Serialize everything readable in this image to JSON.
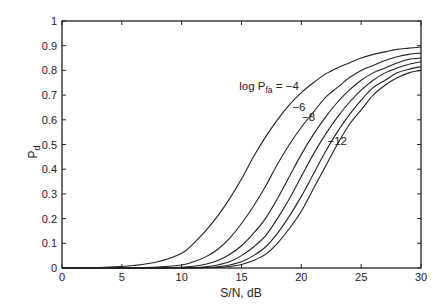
{
  "chart_data": {
    "type": "line",
    "title": "",
    "xlabel": "S/N, dB",
    "ylabel": "P_d",
    "ylabel_main": "P",
    "ylabel_sub": "d",
    "xlim": [
      0,
      30
    ],
    "ylim": [
      0,
      1
    ],
    "xticks": [
      0,
      5,
      10,
      15,
      20,
      25,
      30
    ],
    "yticks": [
      0,
      0.1,
      0.2,
      0.3,
      0.4,
      0.5,
      0.6,
      0.7,
      0.8,
      0.9,
      1
    ],
    "grid": false,
    "legend": "none",
    "x": [
      0,
      2,
      4,
      6,
      8,
      10,
      11,
      12,
      13,
      14,
      15,
      16,
      17,
      18,
      19,
      20,
      21,
      22,
      23,
      24,
      25,
      26,
      27,
      28,
      29,
      30
    ],
    "series": [
      {
        "name": "log Pfa = -4",
        "values": [
          0.0,
          0.001,
          0.004,
          0.01,
          0.025,
          0.06,
          0.1,
          0.15,
          0.21,
          0.28,
          0.36,
          0.45,
          0.53,
          0.6,
          0.66,
          0.71,
          0.75,
          0.785,
          0.81,
          0.83,
          0.85,
          0.865,
          0.875,
          0.885,
          0.89,
          0.895
        ]
      },
      {
        "name": "log Pfa = -6",
        "values": [
          0.0,
          0.0,
          0.0,
          0.001,
          0.004,
          0.012,
          0.025,
          0.045,
          0.075,
          0.12,
          0.18,
          0.25,
          0.33,
          0.42,
          0.5,
          0.57,
          0.63,
          0.69,
          0.73,
          0.77,
          0.8,
          0.82,
          0.84,
          0.855,
          0.865,
          0.87
        ]
      },
      {
        "name": "log Pfa = -8",
        "values": [
          0.0,
          0.0,
          0.0,
          0.0,
          0.001,
          0.003,
          0.007,
          0.015,
          0.03,
          0.055,
          0.09,
          0.14,
          0.2,
          0.28,
          0.37,
          0.46,
          0.54,
          0.61,
          0.67,
          0.72,
          0.76,
          0.79,
          0.81,
          0.83,
          0.845,
          0.85
        ]
      },
      {
        "name": "log Pfa = -10",
        "values": [
          0.0,
          0.0,
          0.0,
          0.0,
          0.0,
          0.001,
          0.002,
          0.005,
          0.012,
          0.025,
          0.05,
          0.085,
          0.13,
          0.2,
          0.28,
          0.37,
          0.46,
          0.54,
          0.61,
          0.67,
          0.72,
          0.76,
          0.79,
          0.81,
          0.825,
          0.835
        ]
      },
      {
        "name": "log Pfa = -12",
        "values": [
          0.0,
          0.0,
          0.0,
          0.0,
          0.0,
          0.0,
          0.001,
          0.002,
          0.005,
          0.012,
          0.025,
          0.05,
          0.085,
          0.14,
          0.21,
          0.29,
          0.38,
          0.47,
          0.55,
          0.62,
          0.68,
          0.73,
          0.76,
          0.79,
          0.805,
          0.815
        ]
      },
      {
        "name": "log Pfa = -14",
        "values": [
          0.0,
          0.0,
          0.0,
          0.0,
          0.0,
          0.0,
          0.0,
          0.001,
          0.002,
          0.006,
          0.014,
          0.03,
          0.055,
          0.1,
          0.16,
          0.23,
          0.32,
          0.41,
          0.5,
          0.58,
          0.64,
          0.7,
          0.74,
          0.77,
          0.79,
          0.8
        ]
      }
    ],
    "annotations": [
      {
        "text_prefix": "log P",
        "text_sub": "fa",
        "text_suffix": " = −4",
        "x": 17.3,
        "y": 0.72
      },
      {
        "text": "−6",
        "x": 19.8,
        "y": 0.635
      },
      {
        "text": "−8",
        "x": 20.6,
        "y": 0.595
      },
      {
        "text": "−12",
        "x": 23.0,
        "y": 0.5
      }
    ]
  }
}
